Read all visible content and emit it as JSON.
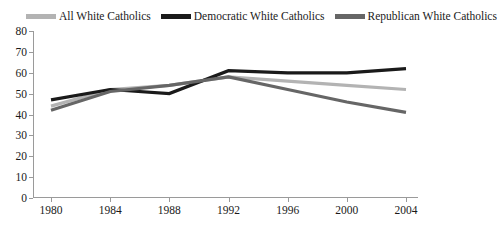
{
  "chart_data": {
    "type": "line",
    "title": "",
    "xlabel": "",
    "ylabel": "",
    "x": [
      1980,
      1984,
      1988,
      1992,
      1996,
      2000,
      2004
    ],
    "xtick_labels": [
      "1980",
      "1984",
      "1988",
      "1992",
      "1996",
      "2000",
      "2004"
    ],
    "ytick_labels": [
      "0",
      "10",
      "20",
      "30",
      "40",
      "50",
      "60",
      "70",
      "80"
    ],
    "yticks": [
      0,
      10,
      20,
      30,
      40,
      50,
      60,
      70,
      80
    ],
    "ylim": [
      0,
      80
    ],
    "grid": false,
    "legend_position": "top",
    "series": [
      {
        "name": "All White Catholics",
        "color": "#b3b3b3",
        "values": [
          44,
          52,
          54,
          58,
          56,
          54,
          52
        ]
      },
      {
        "name": "Democratic White Catholics",
        "color": "#1a1a1a",
        "values": [
          47,
          52,
          50,
          61,
          60,
          60,
          62
        ]
      },
      {
        "name": "Republican White Catholics",
        "color": "#666666",
        "values": [
          42,
          51,
          54,
          58,
          52,
          46,
          41
        ]
      }
    ]
  }
}
